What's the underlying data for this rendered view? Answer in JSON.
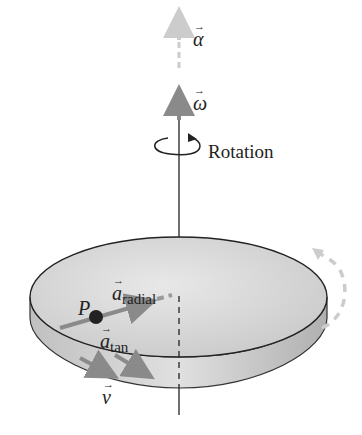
{
  "diagram": {
    "labels": {
      "alpha": "α",
      "omega": "ω",
      "rotation": "Rotation",
      "point": "P",
      "a_radial_symbol": "a",
      "a_radial_sub": "radial",
      "a_tan_symbol": "a",
      "a_tan_sub": "tan",
      "v": "v"
    },
    "colors": {
      "disk_top": "#d8d8d8",
      "disk_edge": "#bdbdbd",
      "axis": "#222222",
      "vector": "#8a8a8a",
      "alpha_vector": "#cfcfcf",
      "point": "#222222"
    }
  }
}
